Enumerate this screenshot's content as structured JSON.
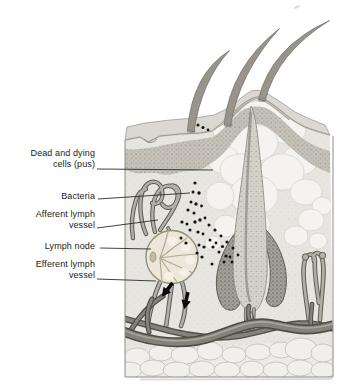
{
  "labels": [
    {
      "line1": "Dead and dying",
      "line2": "cells (pus)"
    },
    {
      "line1": "Bacteria",
      "line2": ""
    },
    {
      "line1": "Afferent lymph",
      "line2": "vessel"
    },
    {
      "line1": "Lymph node",
      "line2": ""
    },
    {
      "line1": "Efferent lymph",
      "line2": "vessel"
    }
  ],
  "colors": {
    "background": "#ffffff",
    "label_text": "#1b1b1b",
    "leader_line": "#2b2b2b",
    "bacteria_dots": "#151515",
    "flow_arrows": "#0a0a0a",
    "pus_region": "#f4f3ef",
    "lymph_node": "#ece7d9",
    "lymph_vessel": "#b2afa7",
    "blood_vessel": "#85827b",
    "epidermis": "#c5c1b8",
    "dermis": "#e7e5e0"
  }
}
